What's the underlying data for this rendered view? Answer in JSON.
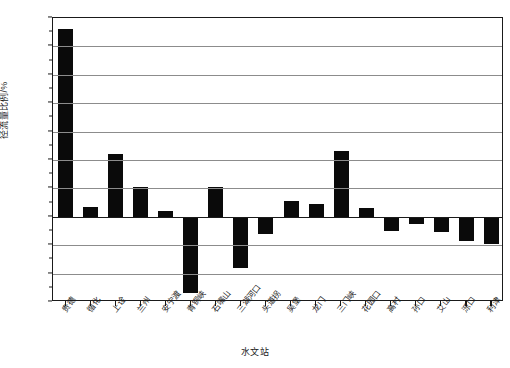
{
  "chart_data": {
    "type": "bar",
    "title": "",
    "xlabel": "水文站",
    "ylabel": "径流量比例/%",
    "ylim": [
      -30,
      70
    ],
    "yticks": [
      70,
      60,
      50,
      40,
      30,
      20,
      10,
      0,
      -10,
      -20,
      -30
    ],
    "ytick_labels": [
      "70",
      "60",
      "50",
      "40",
      "30",
      "20",
      "10",
      "0",
      "-10",
      "-20",
      "-30"
    ],
    "grid": true,
    "legend": "none",
    "categories": [
      "贵德",
      "循化",
      "上诠",
      "兰州",
      "安宁渡",
      "青铜峡",
      "石嘴山",
      "三湖河口",
      "头道拐",
      "吴堡",
      "龙门",
      "三门峡",
      "花园口",
      "高村",
      "孙口",
      "艾山",
      "泺口",
      "利津"
    ],
    "values": [
      66,
      3.5,
      22,
      10.5,
      2,
      -27,
      10.5,
      -18,
      -6,
      5.5,
      4.5,
      23,
      3,
      -5,
      -2.5,
      -5.5,
      -8.5,
      -9.5
    ],
    "bar_color": "#0a0a0a"
  }
}
